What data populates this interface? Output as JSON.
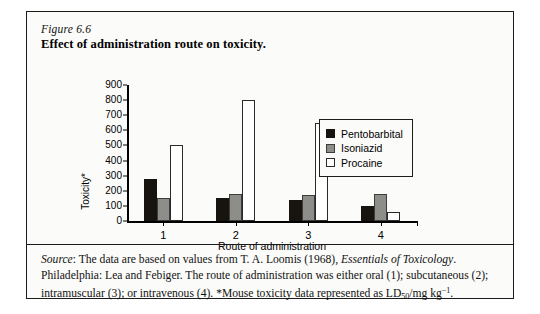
{
  "figure": {
    "number": "Figure 6.6",
    "title": "Effect of administration route on toxicity."
  },
  "chart_data": {
    "type": "bar",
    "title": "Effect of administration route on toxicity.",
    "xlabel": "Route of administration",
    "ylabel": "Toxicity*",
    "categories": [
      "1",
      "2",
      "3",
      "4"
    ],
    "ylim": [
      0,
      900
    ],
    "yticks": [
      0,
      100,
      200,
      300,
      400,
      500,
      600,
      700,
      800,
      900
    ],
    "grid": false,
    "legend_position": "upper-right",
    "series": [
      {
        "name": "Pentobarbital",
        "color": "#17130f",
        "values": [
          280,
          150,
          140,
          100
        ]
      },
      {
        "name": "Isoniazid",
        "color": "#8d8d8a",
        "values": [
          150,
          180,
          170,
          180
        ]
      },
      {
        "name": "Procaine",
        "color": "#ffffff",
        "values": [
          500,
          800,
          650,
          60
        ]
      }
    ]
  },
  "legend": {
    "items": [
      {
        "label": "Pentobarbital"
      },
      {
        "label": "Isoniazid"
      },
      {
        "label": "Procaine"
      }
    ]
  },
  "caption": {
    "source_label": "Source",
    "line1_a": ": The data are based on values from T. A. Loomis (1968), ",
    "line1_italic": "Essentials of Toxicology",
    "line1_b": ". Philadelphia: Lea and Febiger. The route of administration was either oral (1); subcutaneous (2); intramuscular (3); or intravenous (4). *Mouse toxicity data represented as LD",
    "subscript": "50",
    "unit": "/mg kg",
    "superscript": "−1",
    "line_end": "."
  }
}
